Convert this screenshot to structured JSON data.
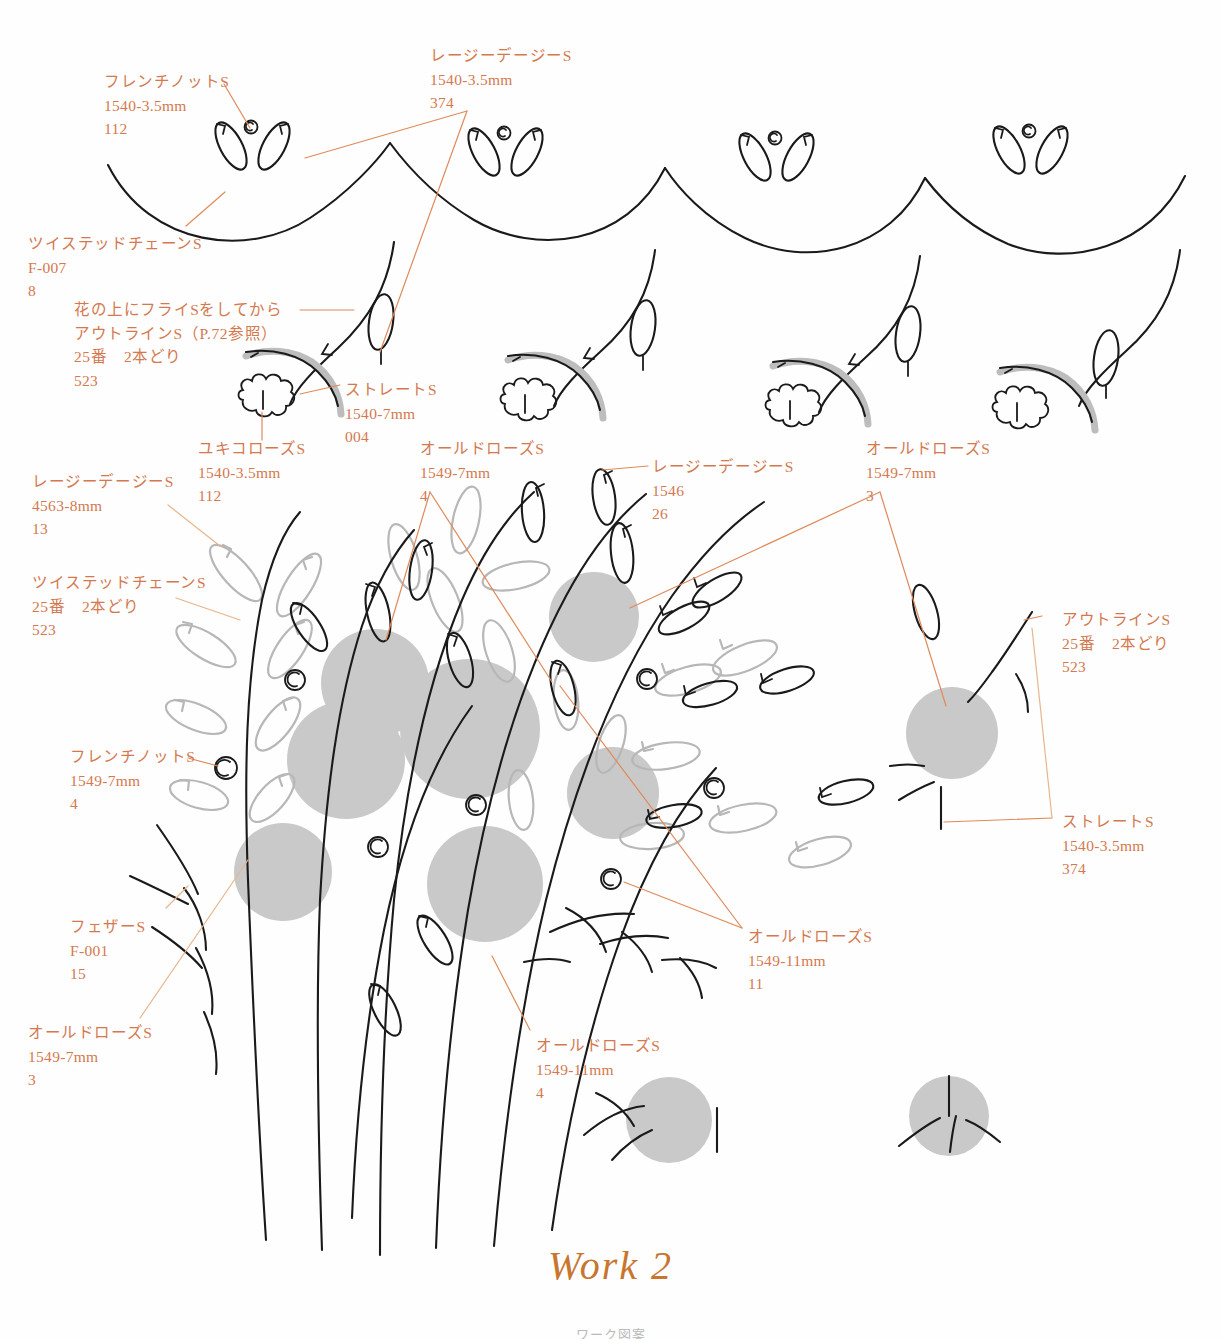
{
  "title": "Work 2",
  "footnote": "ワーク図案",
  "colors": {
    "label_text": "#d4794f",
    "leader_line": "#e08a5a",
    "ink_black": "#1a1a1a",
    "gray_leaf": "#b4b4b4",
    "rose_fill": "#c9c9c9",
    "title": "#c8762f"
  },
  "labels": [
    {
      "id": "french-knot-top",
      "x": 104,
      "y": 70,
      "lines": [
        "フレンチノットS",
        "1540-3.5mm",
        "112"
      ]
    },
    {
      "id": "lazy-daisy-top",
      "x": 430,
      "y": 44,
      "lines": [
        "レージーデージーS",
        "1540-3.5mm",
        "374"
      ]
    },
    {
      "id": "twisted-chain-top",
      "x": 28,
      "y": 232,
      "lines": [
        "ツイステッドチェーンS",
        "F-007",
        "8"
      ]
    },
    {
      "id": "fly-then-outline",
      "x": 74,
      "y": 298,
      "lines": [
        "花の上にフライSをしてから",
        "アウトラインS（P.72参照）",
        "25番　2本どり",
        "523"
      ]
    },
    {
      "id": "straight-top",
      "x": 345,
      "y": 378,
      "lines": [
        "ストレートS",
        "1540-7mm",
        "004"
      ]
    },
    {
      "id": "yukiko-rose",
      "x": 198,
      "y": 437,
      "lines": [
        "ユキコローズS",
        "1540-3.5mm",
        "112"
      ]
    },
    {
      "id": "old-rose-7mm-center",
      "x": 420,
      "y": 437,
      "lines": [
        "オールドローズS",
        "1549-7mm",
        "4"
      ]
    },
    {
      "id": "lazy-daisy-1546",
      "x": 652,
      "y": 455,
      "lines": [
        "レージーデージーS",
        "1546",
        "26"
      ]
    },
    {
      "id": "old-rose-7mm-right",
      "x": 866,
      "y": 437,
      "lines": [
        "オールドローズS",
        "1549-7mm",
        "3"
      ]
    },
    {
      "id": "lazy-daisy-4563",
      "x": 32,
      "y": 470,
      "lines": [
        "レージーデージーS",
        "4563-8mm",
        "13"
      ]
    },
    {
      "id": "twisted-chain-25",
      "x": 32,
      "y": 571,
      "lines": [
        "ツイステッドチェーンS",
        "25番　2本どり",
        "523"
      ]
    },
    {
      "id": "outline-right",
      "x": 1062,
      "y": 608,
      "lines": [
        "アウトラインS",
        "25番　2本どり",
        "523"
      ]
    },
    {
      "id": "french-knot-1549",
      "x": 70,
      "y": 745,
      "lines": [
        "フレンチノットS",
        "1549-7mm",
        "4"
      ]
    },
    {
      "id": "straight-right",
      "x": 1062,
      "y": 810,
      "lines": [
        "ストレートS",
        "1540-3.5mm",
        "374"
      ]
    },
    {
      "id": "feather-f001",
      "x": 70,
      "y": 915,
      "lines": [
        "フェザーS",
        "F-001",
        "15"
      ]
    },
    {
      "id": "old-rose-11mm-right",
      "x": 748,
      "y": 925,
      "lines": [
        "オールドローズS",
        "1549-11mm",
        "11"
      ]
    },
    {
      "id": "old-rose-7mm-left",
      "x": 28,
      "y": 1021,
      "lines": [
        "オールドローズS",
        "1549-7mm",
        "3"
      ]
    },
    {
      "id": "old-rose-11mm-bottom",
      "x": 536,
      "y": 1034,
      "lines": [
        "オールドローズS",
        "1549-11mm",
        "4"
      ]
    }
  ],
  "legend_meta": {
    "stitch_names": [
      "フレンチノットS",
      "レージーデージーS",
      "ツイステッドチェーンS",
      "ストレートS",
      "ユキコローズS",
      "オールドローズS",
      "アウトラインS",
      "フェザーS",
      "フライS"
    ],
    "thread_codes": [
      "1540-3.5mm",
      "1540-7mm",
      "1549-7mm",
      "1549-11mm",
      "4563-8mm",
      "1546",
      "F-007",
      "F-001",
      "25番　2本どり"
    ],
    "color_numbers": [
      "112",
      "374",
      "8",
      "004",
      "4",
      "26",
      "3",
      "13",
      "523",
      "15",
      "11"
    ]
  }
}
